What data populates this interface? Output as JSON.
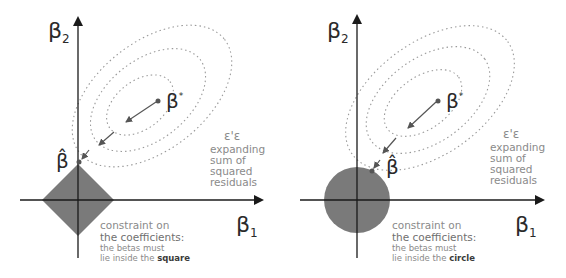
{
  "panels": [
    {
      "id": "lasso",
      "constraint_shape": "square",
      "axis_x_label": "β",
      "axis_x_sub": "1",
      "axis_y_label": "β",
      "axis_y_sub": "2",
      "ols_label": "β",
      "ols_sup": "*",
      "estimate_label": "β̂",
      "rss_symbol": "ε'ε",
      "rss_lines": [
        "expanding",
        "sum of",
        "squared",
        "residuals"
      ],
      "constraint_line1": "constraint on",
      "constraint_line2": "the coefficients:",
      "constraint_line3": "the betas must",
      "constraint_line4_prefix": "lie inside the ",
      "constraint_line4_emph": "square"
    },
    {
      "id": "ridge",
      "constraint_shape": "circle",
      "axis_x_label": "β",
      "axis_x_sub": "1",
      "axis_y_label": "β",
      "axis_y_sub": "2",
      "ols_label": "β",
      "ols_sup": "*",
      "estimate_label": "β̂",
      "rss_symbol": "ε'ε",
      "rss_lines": [
        "expanding",
        "sum of",
        "squared",
        "residuals"
      ],
      "constraint_line1": "constraint on",
      "constraint_line2": "the coefficients:",
      "constraint_line3": "the betas must",
      "constraint_line4_prefix": "lie inside the ",
      "constraint_line4_emph": "circle"
    }
  ],
  "colors": {
    "axis": "#1a1a1a",
    "constraint_fill": "#7a7a7a",
    "contour": "#9a9a9a",
    "arrow": "#555555",
    "text_muted": "#8a8a8a"
  }
}
